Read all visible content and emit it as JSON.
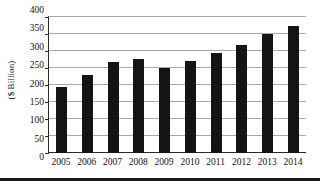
{
  "chart_data": {
    "type": "bar",
    "title": "",
    "subtitle": "",
    "xlabel": "",
    "ylabel": "($ Billion)",
    "categories": [
      "2005",
      "2006",
      "2007",
      "2008",
      "2009",
      "2010",
      "2011",
      "2012",
      "2013",
      "2014"
    ],
    "values": [
      193,
      228,
      268,
      277,
      249,
      270,
      293,
      319,
      350,
      375
    ],
    "series": [
      {
        "name": "Value",
        "values": [
          193,
          228,
          268,
          277,
          249,
          270,
          293,
          319,
          350,
          375
        ]
      }
    ],
    "ylim": [
      0,
      400
    ],
    "ytick_values": [
      0,
      50,
      100,
      150,
      200,
      250,
      300,
      350,
      400
    ],
    "ytick_labels": [
      "0",
      "50",
      "100",
      "150",
      "200",
      "250",
      "300",
      "350",
      "400"
    ],
    "grid": true,
    "grid_axis": "y",
    "legend": false,
    "legend_position": "none",
    "bar_color": "#141414",
    "gridline_color": "#a8a8a8",
    "axis_color": "#2a2a2a",
    "background_color": "#ffffff",
    "annotations": []
  },
  "figure": {
    "bottom_rule": true
  }
}
